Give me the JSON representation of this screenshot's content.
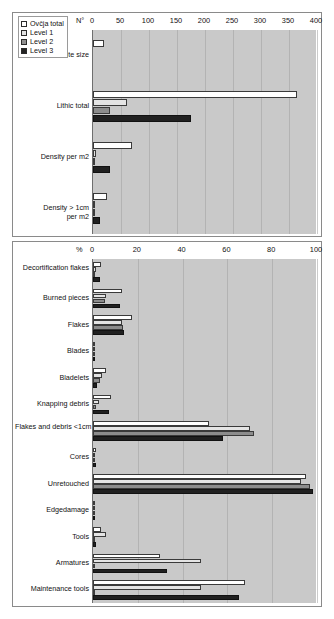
{
  "figure": {
    "background": "#ffffff",
    "plot_background": "#c9c9c9"
  },
  "legend": {
    "position": "top-left",
    "items": [
      {
        "label": "Ovčja total",
        "color": "#ffffff",
        "key": "total"
      },
      {
        "label": "Level 1",
        "color": "#e4e4e4",
        "key": "l1"
      },
      {
        "label": "Level 2",
        "color": "#8c8c8c",
        "key": "l2"
      },
      {
        "label": "Level 3",
        "color": "#202020",
        "key": "l3"
      }
    ]
  },
  "chart_data": [
    {
      "type": "bar",
      "orientation": "horizontal",
      "title": "",
      "xlabel": "N°",
      "ylabel": "",
      "xlim": [
        0,
        400
      ],
      "xticks": [
        0,
        50,
        100,
        150,
        200,
        250,
        300,
        350,
        400
      ],
      "grid": true,
      "legend_position": "top-left",
      "categories": [
        "Site size",
        "Lithic total",
        "Density per m2",
        "Density > 1cm per m2"
      ],
      "series": [
        {
          "name": "Ovčja total",
          "color": "#ffffff",
          "values": [
            20,
            365,
            70,
            25
          ]
        },
        {
          "name": "Level 1",
          "color": "#e4e4e4",
          "values": [
            0,
            60,
            5,
            2
          ]
        },
        {
          "name": "Level 2",
          "color": "#8c8c8c",
          "values": [
            0,
            30,
            3,
            1.5
          ]
        },
        {
          "name": "Level 3",
          "color": "#202020",
          "values": [
            0,
            175,
            30,
            12
          ]
        }
      ]
    },
    {
      "type": "bar",
      "orientation": "horizontal",
      "title": "",
      "xlabel": "%",
      "ylabel": "",
      "xlim": [
        0,
        100
      ],
      "xticks": [
        0,
        20,
        40,
        60,
        80,
        100
      ],
      "grid": true,
      "categories": [
        "Decortification flakes",
        "Burned pieces",
        "Flakes",
        "Blades",
        "Bladelets",
        "Knapping debris",
        "Flakes and debris <1cm",
        "Cores",
        "Unretouched",
        "Edgedamage",
        "Tools",
        "Armatures",
        "Maintenance tools"
      ],
      "series": [
        {
          "name": "Ovčja total",
          "color": "#ffffff",
          "values": [
            3.5,
            13,
            17.5,
            0.3,
            6,
            8,
            52,
            1.5,
            95,
            0.8,
            3.5,
            30,
            68
          ]
        },
        {
          "name": "Level 1",
          "color": "#e4e4e4",
          "values": [
            1.5,
            6,
            13,
            0.2,
            4,
            2.5,
            70,
            1.0,
            93,
            0.5,
            6,
            48,
            48
          ]
        },
        {
          "name": "Level 2",
          "color": "#8c8c8c",
          "values": [
            0.5,
            5.5,
            13.5,
            0.1,
            3,
            1.5,
            72,
            0.8,
            97,
            0.3,
            0.4,
            0.4,
            0.4
          ]
        },
        {
          "name": "Level 3",
          "color": "#202020",
          "values": [
            3,
            12,
            14,
            0.2,
            2,
            7,
            58,
            1.5,
            98,
            0.5,
            1.5,
            33,
            65
          ]
        }
      ]
    }
  ]
}
